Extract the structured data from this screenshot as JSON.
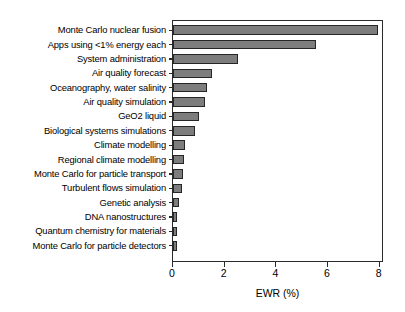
{
  "chart_data": {
    "type": "bar",
    "orientation": "horizontal",
    "title": "",
    "xlabel": "EWR (%)",
    "ylabel": "",
    "xlim": [
      0,
      8.17
    ],
    "ylim": null,
    "grid": false,
    "legend": null,
    "xticks": [
      "0",
      "2",
      "4",
      "6",
      "8"
    ],
    "xtick_values": [
      0,
      2,
      4,
      6,
      8
    ],
    "categories": [
      "Monte Carlo nuclear fusion",
      "Apps using <1% energy each",
      "System administration",
      "Air quality forecast",
      "Oceanography, water salinity",
      "Air quality simulation",
      "GeO2 liquid",
      "Biological systems simulations",
      "Climate modelling",
      "Regional climate modelling",
      "Monte Carlo for particle transport",
      "Turbulent flows simulation",
      "Genetic analysis",
      "DNA nanostructures",
      "Quantum chemistry for materials",
      "Monte Carlo for particle detectors"
    ],
    "values": [
      7.93,
      5.53,
      2.5,
      1.5,
      1.32,
      1.25,
      1.02,
      0.85,
      0.47,
      0.43,
      0.37,
      0.33,
      0.25,
      0.16,
      0.15,
      0.14
    ],
    "bar_color": "#7d7d7d",
    "bar_edge_color": "#262626",
    "axis_color": "#2a2a2a"
  }
}
